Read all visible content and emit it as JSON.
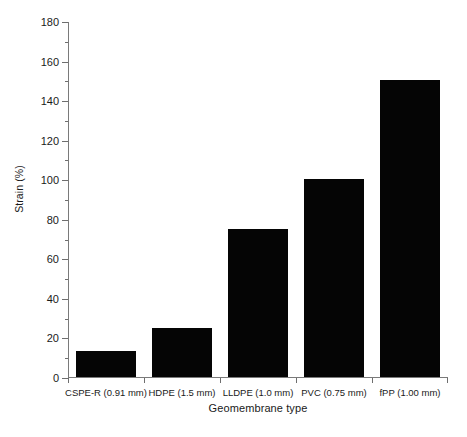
{
  "chart_data": {
    "type": "bar",
    "title": "",
    "xlabel": "Geomembrane type",
    "ylabel": "Strain (%)",
    "categories": [
      "CSPE-R (0.91 mm)",
      "HDPE (1.5 mm)",
      "LLDPE (1.0 mm)",
      "PVC (0.75 mm)",
      "fPP (1.00 mm)"
    ],
    "values": [
      13,
      25,
      75,
      100,
      150
    ],
    "ylim": [
      0,
      180
    ],
    "ytick_step": 20,
    "yminor_step": 10,
    "ytick_labels": [
      "0",
      "20",
      "40",
      "60",
      "80",
      "100",
      "120",
      "140",
      "160",
      "180"
    ],
    "grid": false,
    "legend": null,
    "bar_color": "#050505",
    "axis_color": "#7a7a7a",
    "background": "#ffffff"
  }
}
